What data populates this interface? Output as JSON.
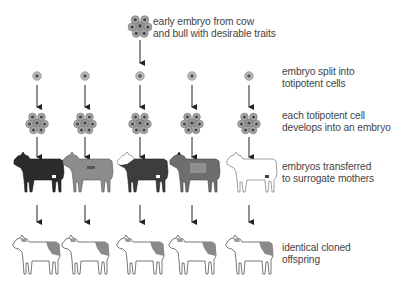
{
  "diagram": {
    "title_step": {
      "label_line1": "early embryo from cow",
      "label_line2": "and bull with desirable traits",
      "icon": "early-embryo-icon"
    },
    "steps": [
      {
        "id": "split",
        "label_line1": "embryo split into",
        "label_line2": "totipotent cells",
        "icon": "single-cell-icon"
      },
      {
        "id": "develop",
        "label_line1": "each totipotent cell",
        "label_line2": "develops into an embryo",
        "icon": "embryo-cluster-icon"
      },
      {
        "id": "transfer",
        "label_line1": "embryos transferred",
        "label_line2": "to surrogate mothers",
        "icon": "surrogate-cow-icon"
      },
      {
        "id": "offspring",
        "label_line1": "identical cloned",
        "label_line2": "offspring",
        "icon": "cloned-calf-icon"
      }
    ],
    "columns": 5,
    "surrogate_colors": [
      "#2b2b2b",
      "#8c8c8c",
      "#3d3d3d",
      "#6e6e6e",
      "#ffffff"
    ],
    "offspring_patch_color": "#8a8a8a",
    "arrow_color": "#222222"
  }
}
